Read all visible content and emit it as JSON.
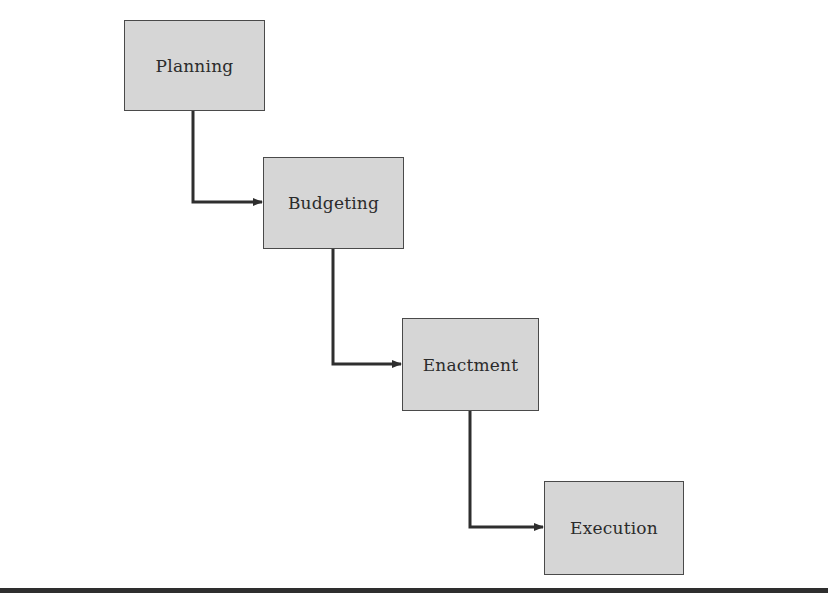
{
  "diagram": {
    "type": "staircase-flow",
    "nodes": [
      {
        "id": "planning",
        "label": "Planning"
      },
      {
        "id": "budgeting",
        "label": "Budgeting"
      },
      {
        "id": "enactment",
        "label": "Enactment"
      },
      {
        "id": "execution",
        "label": "Execution"
      }
    ],
    "edges": [
      {
        "from": "planning",
        "to": "budgeting"
      },
      {
        "from": "budgeting",
        "to": "enactment"
      },
      {
        "from": "enactment",
        "to": "execution"
      }
    ],
    "colors": {
      "node_fill": "#d6d6d6",
      "node_border": "#4a4a4a",
      "arrow": "#2e2e2e",
      "rule": "#2e2e2e",
      "background": "#ffffff"
    }
  }
}
